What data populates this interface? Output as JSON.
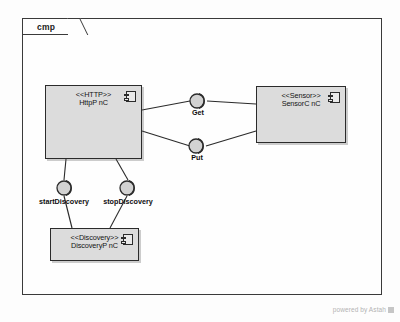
{
  "diagram": {
    "frame_label": "cmp",
    "watermark": "powered by Astah"
  },
  "components": [
    {
      "id": "http",
      "stereotype": "<<HTTP>>",
      "name": "HttpP nC",
      "icon": "component-icon"
    },
    {
      "id": "sensor",
      "stereotype": "<<Sensor>>",
      "name": "SensorC nC",
      "icon": "component-icon"
    },
    {
      "id": "discovery",
      "stereotype": "<<Discovery>>",
      "name": "DiscoveryP nC",
      "icon": "component-icon"
    }
  ],
  "interfaces": [
    {
      "id": "get",
      "label": "Get",
      "kind": "assembly-connector"
    },
    {
      "id": "put",
      "label": "Put",
      "kind": "assembly-connector"
    }
  ],
  "ports": [
    {
      "id": "start-discovery",
      "label": "startDiscovery",
      "kind": "assembly-connector"
    },
    {
      "id": "stop-discovery",
      "label": "stopDiscovery",
      "kind": "assembly-connector"
    }
  ],
  "colors": {
    "component_fill": "#dcdcdc",
    "component_stroke": "#2b2b2b",
    "frame_stroke": "#3a3a3a",
    "background": "#fdfdfd"
  }
}
